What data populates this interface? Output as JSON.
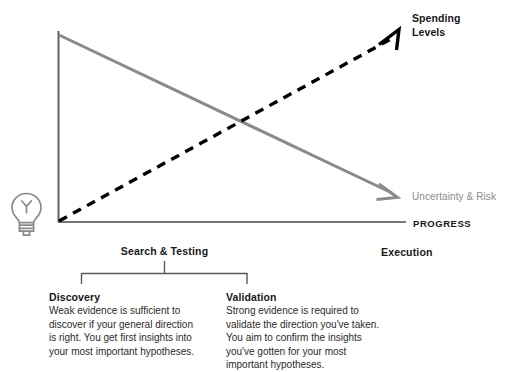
{
  "diagram": {
    "title_axes": {
      "x_axis_label": "PROGRESS",
      "y_axis_label": ""
    },
    "series": [
      {
        "name": "spending-levels",
        "label": "Spending Levels",
        "style": "dashed",
        "color": "#000000",
        "direction": "rising",
        "arrow": true
      },
      {
        "name": "uncertainty-risk",
        "label": "Uncertainty & Risk",
        "style": "solid",
        "color": "#8a8a8a",
        "direction": "falling",
        "arrow": true
      }
    ],
    "phases": {
      "left_label": "Search & Testing",
      "right_label": "Execution"
    },
    "cards": [
      {
        "id": "discovery",
        "title": "Discovery",
        "body": "Weak evidence is sufficient to discover if your general direction is right. You get first insights into your most important hypotheses."
      },
      {
        "id": "validation",
        "title": "Validation",
        "body": "Strong evidence is required to validate the direction you've taken. You aim to confirm the insights you've gotten for your most important hypotheses."
      }
    ],
    "icon": {
      "name": "lightbulb-icon",
      "color": "#8a8a8a"
    },
    "colors": {
      "axis": "#5a5a5a",
      "dashed_line": "#000000",
      "solid_line": "#8a8a8a",
      "text": "#17181a",
      "muted_text": "#8a8a8a",
      "bracket": "#5a5a5a",
      "background": "#ffffff"
    }
  }
}
